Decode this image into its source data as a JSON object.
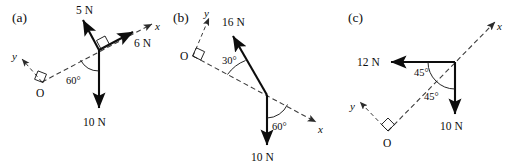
{
  "figure": {
    "background_color": "#ffffff",
    "stroke_color": "#0d0d0d",
    "axis_color": "#3d3d3d",
    "panels": [
      {
        "key": "a",
        "label": "(a)",
        "origin_label": "O",
        "axis_x_label": "x",
        "axis_y_label": "y",
        "forces": [
          {
            "label": "5 N",
            "magnitude": 5,
            "unit": "N",
            "direction": "up-left"
          },
          {
            "label": "6 N",
            "magnitude": 6,
            "unit": "N",
            "direction": "up-right-along-x"
          },
          {
            "label": "10 N",
            "magnitude": 10,
            "unit": "N",
            "direction": "down"
          }
        ],
        "angles": [
          {
            "label": "60°",
            "value": 60,
            "between": "x-axis and 10 N"
          }
        ],
        "right_angle_marks": 2
      },
      {
        "key": "b",
        "label": "(b)",
        "origin_label": "O",
        "axis_x_label": "x",
        "axis_y_label": "y",
        "forces": [
          {
            "label": "16 N",
            "magnitude": 16,
            "unit": "N",
            "direction": "up-left"
          },
          {
            "label": "10 N",
            "magnitude": 10,
            "unit": "N",
            "direction": "down"
          }
        ],
        "angles": [
          {
            "label": "30°",
            "value": 30,
            "between": "x-axis and 16 N"
          },
          {
            "label": "60°",
            "value": 60,
            "between": "10 N and x-axis"
          }
        ],
        "right_angle_marks": 1
      },
      {
        "key": "c",
        "label": "(c)",
        "origin_label": "O",
        "axis_x_label": "x",
        "axis_y_label": "y",
        "forces": [
          {
            "label": "12 N",
            "magnitude": 12,
            "unit": "N",
            "direction": "left"
          },
          {
            "label": "10 N",
            "magnitude": 10,
            "unit": "N",
            "direction": "down"
          }
        ],
        "angles": [
          {
            "label": "45°",
            "value": 45,
            "between": "12 N and x-axis"
          },
          {
            "label": "45°",
            "value": 45,
            "between": "x-axis and 10 N"
          }
        ],
        "right_angle_marks": 1
      }
    ]
  }
}
